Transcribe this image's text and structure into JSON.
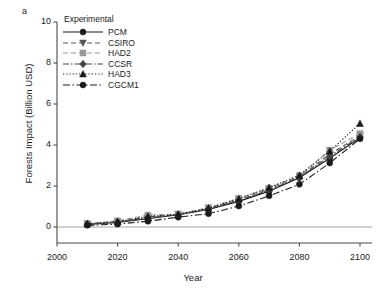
{
  "panel": {
    "label": "a"
  },
  "legend": {
    "title": "Experimental",
    "entries": [
      {
        "name": "PCM",
        "marker": "circle",
        "dash": "solid",
        "color": "#1a1a1a"
      },
      {
        "name": "CSIRO",
        "marker": "triangle-down",
        "dash": "dashed",
        "color": "#555555"
      },
      {
        "name": "HAD2",
        "marker": "square",
        "dash": "dashed-light",
        "color": "#999999"
      },
      {
        "name": "CCSR",
        "marker": "diamond",
        "dash": "dash-dot",
        "color": "#444444"
      },
      {
        "name": "HAD3",
        "marker": "triangle-up",
        "dash": "dotted",
        "color": "#1a1a1a"
      },
      {
        "name": "CGCM1",
        "marker": "circle",
        "dash": "dash-dot-long",
        "color": "#1a1a1a"
      }
    ]
  },
  "chart_data": {
    "type": "line",
    "title": "",
    "xlabel": "Year",
    "ylabel": "Forests Impact (Billion USD)",
    "xlim": [
      2000,
      2100
    ],
    "ylim": [
      0,
      10
    ],
    "xticks": [
      2000,
      2020,
      2040,
      2060,
      2080,
      2100
    ],
    "yticks": [
      0,
      2,
      4,
      6,
      8,
      10
    ],
    "grid": false,
    "zero_line": true,
    "legend_position": "top-left",
    "x": [
      2010,
      2020,
      2030,
      2040,
      2050,
      2060,
      2070,
      2080,
      2090,
      2100
    ],
    "series": [
      {
        "name": "PCM",
        "values": [
          0.12,
          0.22,
          0.4,
          0.6,
          0.85,
          1.25,
          1.75,
          2.4,
          3.35,
          4.35
        ]
      },
      {
        "name": "CSIRO",
        "values": [
          0.15,
          0.25,
          0.48,
          0.62,
          0.9,
          1.32,
          1.85,
          2.45,
          3.55,
          4.45
        ]
      },
      {
        "name": "HAD2",
        "values": [
          0.18,
          0.3,
          0.58,
          0.63,
          0.95,
          1.4,
          1.9,
          2.5,
          3.75,
          4.55
        ]
      },
      {
        "name": "CCSR",
        "values": [
          0.14,
          0.24,
          0.45,
          0.6,
          0.88,
          1.28,
          1.8,
          2.42,
          3.45,
          4.4
        ]
      },
      {
        "name": "HAD3",
        "values": [
          0.16,
          0.26,
          0.52,
          0.62,
          0.92,
          1.38,
          1.92,
          2.52,
          3.7,
          5.05
        ]
      },
      {
        "name": "CGCM1",
        "values": [
          0.08,
          0.14,
          0.28,
          0.48,
          0.65,
          1.02,
          1.52,
          2.08,
          3.12,
          4.3
        ]
      }
    ]
  }
}
